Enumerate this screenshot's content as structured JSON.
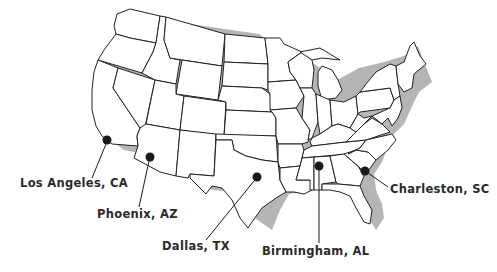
{
  "map": {
    "region": "Contiguous United States",
    "style": "outline map with state borders and drop shadow",
    "colors": {
      "land": "#ffffff",
      "border": "#222222",
      "shadow": "#b5b5b5",
      "marker": "#1a1a1a",
      "label": "#2a2a2a"
    }
  },
  "locations": [
    {
      "id": "los-angeles",
      "label": "Los Angeles, CA",
      "dot": [
        107,
        140
      ],
      "label_pos": [
        20,
        176
      ]
    },
    {
      "id": "phoenix",
      "label": "Phoenix, AZ",
      "dot": [
        150,
        157
      ],
      "label_pos": [
        97,
        207
      ]
    },
    {
      "id": "dallas",
      "label": "Dallas, TX",
      "dot": [
        257,
        177
      ],
      "label_pos": [
        162,
        239
      ]
    },
    {
      "id": "birmingham",
      "label": "Birmingham, AL",
      "dot": [
        319,
        166
      ],
      "label_pos": [
        262,
        244
      ]
    },
    {
      "id": "charleston",
      "label": "Charleston, SC",
      "dot": [
        365,
        171
      ],
      "label_pos": [
        390,
        182
      ]
    }
  ]
}
